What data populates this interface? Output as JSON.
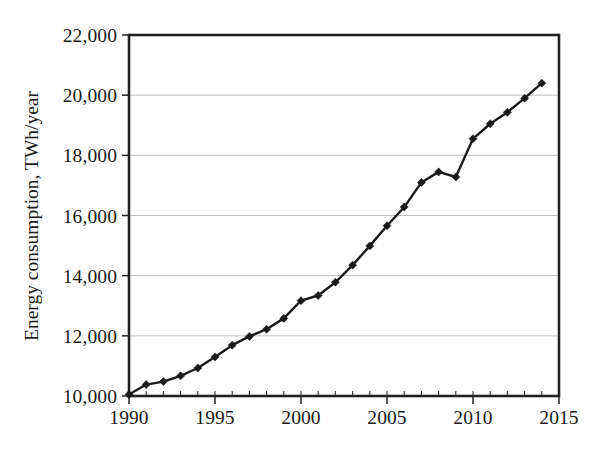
{
  "chart_data": {
    "type": "line",
    "title": "",
    "subtitle": "",
    "xlabel": "",
    "ylabel": "Energy consumption, TWh/year",
    "xlim": [
      1990,
      2015
    ],
    "ylim": [
      10000,
      22000
    ],
    "xticks": [
      1990,
      1995,
      2000,
      2005,
      2010,
      2015
    ],
    "xtick_labels": [
      "1990",
      "1995",
      "2000",
      "2005",
      "2010",
      "2015"
    ],
    "yticks": [
      10000,
      12000,
      14000,
      16000,
      18000,
      20000,
      22000
    ],
    "ytick_labels": [
      "10,000",
      "12,000",
      "14,000",
      "16,000",
      "18,000",
      "20,000",
      "22,000"
    ],
    "x_minor_tick_step": 1,
    "grid": "horizontal",
    "legend": "none",
    "marker": "diamond",
    "line_color": "#1b1b1b",
    "grid_color": "#b9b9b9",
    "axis_color": "#222222",
    "x": [
      1990,
      1991,
      1992,
      1993,
      1994,
      1995,
      1996,
      1997,
      1998,
      1999,
      2000,
      2001,
      2002,
      2003,
      2004,
      2005,
      2006,
      2007,
      2008,
      2009,
      2010,
      2011,
      2012,
      2013,
      2014
    ],
    "series": [
      {
        "name": "Energy consumption",
        "values": [
          10050,
          10380,
          10480,
          10670,
          10930,
          11300,
          11690,
          11980,
          12220,
          12580,
          13170,
          13340,
          13780,
          14350,
          14990,
          15660,
          16280,
          17100,
          17450,
          17280,
          18550,
          19050,
          19430,
          19900,
          20400
        ]
      }
    ]
  },
  "axis_titles": {
    "y": "Energy consumption, TWh/year"
  },
  "bleed_through": {
    "line1": "",
    "line2": ""
  }
}
